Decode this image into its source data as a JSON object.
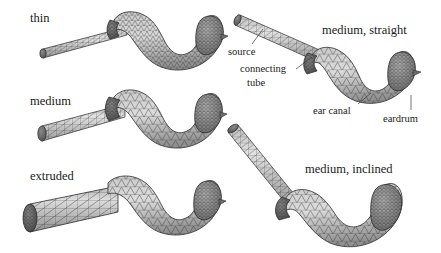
{
  "figure": {
    "background_color": "#ffffff",
    "ink_color": "#1a1a1a",
    "mesh_edge_color": "#2e2e2e",
    "mesh_fill_light": "#d8d8d8",
    "mesh_fill_dark": "#8c8c8c"
  },
  "models": {
    "thin": {
      "label": "thin",
      "label_x": 30,
      "label_y": 12,
      "mesh_density": "fine",
      "tube": "thin narrow connecting tube",
      "orientation": "horizontal"
    },
    "medium": {
      "label": "medium",
      "label_x": 30,
      "label_y": 95,
      "mesh_density": "medium",
      "tube": "medium width connecting tube",
      "orientation": "horizontal"
    },
    "extruded": {
      "label": "extruded",
      "label_x": 30,
      "label_y": 170,
      "mesh_density": "structured extruded",
      "tube": "wide extruded connecting tube",
      "orientation": "horizontal"
    },
    "medium_straight": {
      "label": "medium, straight",
      "label_x": 322,
      "label_y": 24,
      "mesh_density": "medium",
      "tube": "straight connecting tube",
      "orientation": "straight"
    },
    "medium_inclined": {
      "label": "medium, inclined",
      "label_x": 305,
      "label_y": 163,
      "mesh_density": "medium",
      "tube": "inclined connecting tube",
      "orientation": "inclined"
    }
  },
  "annotations": [
    {
      "id": "source",
      "label": "source",
      "label_x": 228,
      "label_y": 47,
      "leader": {
        "x1": 252,
        "y1": 46,
        "x2": 262,
        "y2": 30
      }
    },
    {
      "id": "connecting-tube",
      "label_line1": "connecting",
      "label_line2": "tube",
      "label_x": 240,
      "label_y": 64,
      "leader": {
        "x1": 297,
        "y1": 70,
        "x2": 312,
        "y2": 57
      }
    },
    {
      "id": "ear-canal",
      "label": "ear canal",
      "label_x": 313,
      "label_y": 106,
      "leader": {
        "x1": 358,
        "y1": 106,
        "x2": 372,
        "y2": 94
      }
    },
    {
      "id": "eardrum",
      "label": "eardrum",
      "label_x": 383,
      "label_y": 114,
      "leader": {
        "x1": 411,
        "y1": 111,
        "x2": 411,
        "y2": 95
      }
    }
  ]
}
